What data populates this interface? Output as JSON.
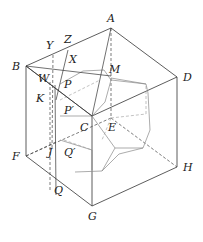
{
  "diagram": {
    "type": "cube-with-inscribed-polyhedron",
    "labels": {
      "A": "A",
      "B": "B",
      "C": "C",
      "D": "D",
      "E": "E",
      "F": "F",
      "G": "G",
      "H": "H",
      "M": "M",
      "X": "X",
      "Y": "Y",
      "Z": "Z",
      "W": "W",
      "P": "P",
      "P2": "P′",
      "K": "K",
      "J": "J",
      "Q": "Q",
      "Q2": "Q′"
    },
    "colors": {
      "edge": "#333333",
      "polyhedron": "#888888",
      "label": "#222222"
    }
  }
}
